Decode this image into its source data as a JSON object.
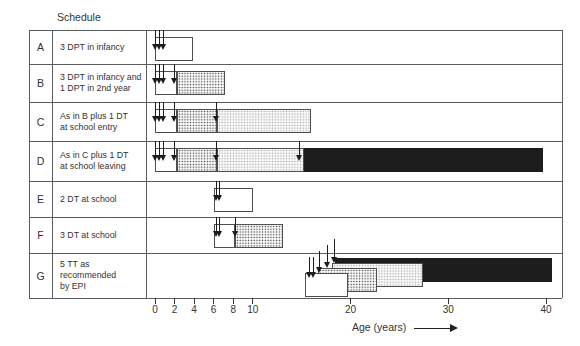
{
  "header": {
    "title": "Schedule"
  },
  "axis": {
    "label": "Age (years)",
    "ticks": [
      0,
      2,
      4,
      6,
      8,
      10,
      20,
      30,
      40
    ],
    "min": 0,
    "max": 40
  },
  "chart_data": {
    "type": "bar",
    "subtype": "gantt-timeline",
    "title": "Schedule",
    "xlabel": "Age (years)",
    "x_ticks": [
      0,
      2,
      4,
      6,
      8,
      10,
      20,
      30,
      40
    ],
    "x_range": [
      0,
      40
    ],
    "bar_styles": [
      "white",
      "dots",
      "lightdots",
      "black"
    ],
    "rows": [
      {
        "letter": "A",
        "label": "3 DPT in infancy",
        "doses": [
          {
            "age": 0.1
          },
          {
            "age": 0.5
          },
          {
            "age": 0.85
          }
        ],
        "bars": [
          {
            "from": 0,
            "to": 3.9,
            "style": "white"
          }
        ]
      },
      {
        "letter": "B",
        "label": "3 DPT in infancy and\n1 DPT in 2nd year",
        "doses": [
          {
            "age": 0.1
          },
          {
            "age": 0.5
          },
          {
            "age": 0.85
          },
          {
            "age": 1.95
          }
        ],
        "bars": [
          {
            "from": 0,
            "to": 2.2,
            "style": "white"
          },
          {
            "from": 2.2,
            "to": 7.2,
            "style": "dots"
          }
        ]
      },
      {
        "letter": "C",
        "label": "As in B plus 1 DT\nat school entry",
        "doses": [
          {
            "age": 0.1
          },
          {
            "age": 0.5
          },
          {
            "age": 0.85
          },
          {
            "age": 1.95
          },
          {
            "age": 6.25
          }
        ],
        "bars": [
          {
            "from": 0,
            "to": 2.2,
            "style": "white"
          },
          {
            "from": 2.2,
            "to": 6.3,
            "style": "dots"
          },
          {
            "from": 6.3,
            "to": 16.0,
            "style": "lightdots"
          }
        ]
      },
      {
        "letter": "D",
        "label": "As in C plus 1 DT\nat school leaving",
        "doses": [
          {
            "age": 0.1
          },
          {
            "age": 0.5
          },
          {
            "age": 0.85
          },
          {
            "age": 1.95
          },
          {
            "age": 6.25
          },
          {
            "age": 14.75
          }
        ],
        "bars": [
          {
            "from": 0,
            "to": 2.2,
            "style": "white"
          },
          {
            "from": 2.2,
            "to": 6.3,
            "style": "dots"
          },
          {
            "from": 6.3,
            "to": 15.2,
            "style": "lightdots"
          },
          {
            "from": 15.2,
            "to": 39.7,
            "style": "black"
          }
        ]
      },
      {
        "letter": "E",
        "label": "2 DT at school",
        "doses": [
          {
            "age": 6.25
          },
          {
            "age": 6.6
          }
        ],
        "bars": [
          {
            "from": 6.0,
            "to": 10.0,
            "style": "white"
          }
        ]
      },
      {
        "letter": "F",
        "label": "3 DT at school",
        "doses": [
          {
            "age": 6.25
          },
          {
            "age": 6.6
          },
          {
            "age": 8.25
          }
        ],
        "bars": [
          {
            "from": 6.0,
            "to": 8.2,
            "style": "white"
          },
          {
            "from": 8.2,
            "to": 13.1,
            "style": "dots"
          }
        ]
      },
      {
        "letter": "G",
        "label": "5 TT as recommended\nby EPI",
        "doses": [
          {
            "age": 15.85,
            "tier": 1
          },
          {
            "age": 16.2,
            "tier": 1
          },
          {
            "age": 16.8,
            "tier": 2
          },
          {
            "age": 17.6,
            "tier": 3
          },
          {
            "age": 18.4,
            "tier": 4
          }
        ],
        "bars": [
          {
            "from": 15.3,
            "to": 19.7,
            "style": "white",
            "tier": 1
          },
          {
            "from": 16.7,
            "to": 22.7,
            "style": "dots",
            "tier": 2
          },
          {
            "from": 18.1,
            "to": 27.4,
            "style": "lightdots",
            "tier": 3
          },
          {
            "from": 18.4,
            "to": 40.6,
            "style": "black",
            "tier": 4
          }
        ]
      }
    ]
  },
  "colors": {
    "line": "#5c5c5c",
    "bar_border": "#4f4f4f",
    "black_bar": "#1d1d1d",
    "text": "#333333",
    "background": "#ffffff"
  }
}
